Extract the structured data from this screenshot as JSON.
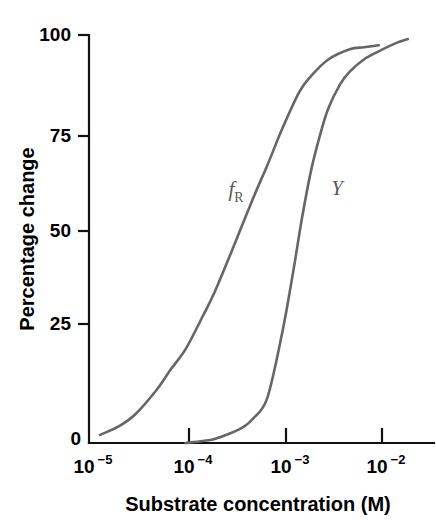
{
  "chart_data": {
    "type": "line",
    "title": "",
    "xlabel": "Substrate concentration (M)",
    "ylabel": "Percentage change",
    "xscale": "log",
    "xlim": [
      1e-05,
      0.02
    ],
    "ylim": [
      0,
      100
    ],
    "grid": false,
    "legend_position": "inline-annotation",
    "xtick_labels": [
      "10–5",
      "10–4",
      "10–3",
      "10–2"
    ],
    "xtick_bases": [
      "10",
      "10",
      "10",
      "10"
    ],
    "xtick_exponents": [
      "−5",
      "−4",
      "−3",
      "−2"
    ],
    "xtick_values": [
      1e-05,
      0.0001,
      0.001,
      0.01
    ],
    "ytick_labels": [
      "0",
      "25",
      "50",
      "75",
      "100"
    ],
    "ytick_values": [
      0,
      25,
      50,
      75,
      100
    ],
    "series": [
      {
        "name": "fR",
        "label_base": "f",
        "label_sub": "R",
        "color": "#666666",
        "x": [
          1.3e-05,
          2e-05,
          3e-05,
          5e-05,
          7e-05,
          0.0001,
          0.00015,
          0.0002,
          0.0003,
          0.0005,
          0.0007,
          0.001,
          0.0015,
          0.002,
          0.003,
          0.005,
          0.007,
          0.01
        ],
        "y": [
          2,
          4,
          7,
          13,
          18,
          23,
          31,
          37,
          47,
          60,
          68,
          77,
          86,
          90,
          94,
          96.5,
          97,
          97.5
        ]
      },
      {
        "name": "Y",
        "label_base": "Y",
        "label_sub": "",
        "color": "#666666",
        "x": [
          0.0001,
          0.00015,
          0.0002,
          0.0003,
          0.0004,
          0.0005,
          0.0007,
          0.001,
          0.0013,
          0.0016,
          0.002,
          0.0025,
          0.003,
          0.004,
          0.005,
          0.007,
          0.01,
          0.015,
          0.02
        ],
        "y": [
          0,
          0.5,
          1,
          2.5,
          4,
          6,
          11,
          27,
          42,
          55,
          67,
          76,
          82,
          88,
          91,
          94,
          96,
          98,
          99
        ]
      }
    ],
    "annotations": [
      {
        "text": "fR",
        "x_px": 236,
        "y_px": 190
      },
      {
        "text": "Y",
        "x_px": 337,
        "y_px": 189
      }
    ]
  },
  "axis": {
    "y_title": "Percentage change",
    "x_title": "Substrate concentration (M)",
    "y_labels": {
      "t100": "100",
      "t75": "75",
      "t50": "50",
      "t25": "25",
      "t0": "0"
    },
    "x_labels": {
      "t1": {
        "base": "10",
        "exp": "−5"
      },
      "t2": {
        "base": "10",
        "exp": "−4"
      },
      "t3": {
        "base": "10",
        "exp": "−3"
      },
      "t4": {
        "base": "10",
        "exp": "−2"
      }
    }
  },
  "curves": {
    "fr": {
      "base": "f",
      "sub": "R"
    },
    "y": {
      "base": "Y",
      "sub": ""
    }
  },
  "colors": {
    "curve": "#666666",
    "axis": "#111111",
    "text": "#000000",
    "background": "#ffffff"
  }
}
